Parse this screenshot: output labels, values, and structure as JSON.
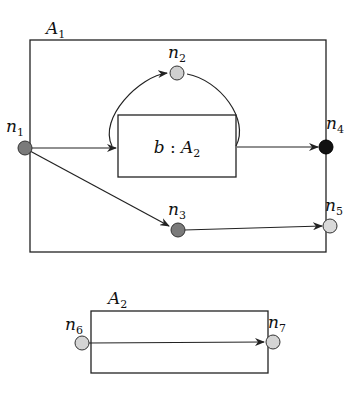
{
  "diagram": {
    "automata": [
      {
        "id": "A1",
        "name": "A",
        "subscript": "1"
      },
      {
        "id": "A2",
        "name": "A",
        "subscript": "2"
      }
    ],
    "instance_box": {
      "label_var": "b",
      "separator": " : ",
      "type_name": "A",
      "type_subscript": "2"
    },
    "nodes": [
      {
        "id": "n1",
        "name": "n",
        "subscript": "1",
        "fill": "#7a7a7a"
      },
      {
        "id": "n2",
        "name": "n",
        "subscript": "2",
        "fill": "#cfcfcf"
      },
      {
        "id": "n3",
        "name": "n",
        "subscript": "3",
        "fill": "#7a7a7a"
      },
      {
        "id": "n4",
        "name": "n",
        "subscript": "4",
        "fill": "#111111"
      },
      {
        "id": "n5",
        "name": "n",
        "subscript": "5",
        "fill": "#d9d9d9"
      },
      {
        "id": "n6",
        "name": "n",
        "subscript": "6",
        "fill": "#d4d4d4"
      },
      {
        "id": "n7",
        "name": "n",
        "subscript": "7",
        "fill": "#d4d4d4"
      }
    ],
    "edges": [
      {
        "from": "n1",
        "to": "b"
      },
      {
        "from": "b",
        "to": "n2"
      },
      {
        "from": "n2",
        "to": "b"
      },
      {
        "from": "b",
        "to": "n4"
      },
      {
        "from": "n1",
        "to": "n3"
      },
      {
        "from": "n3",
        "to": "n5"
      },
      {
        "from": "n6",
        "to": "n7"
      }
    ]
  }
}
